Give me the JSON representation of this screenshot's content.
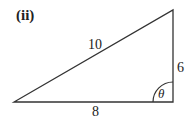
{
  "figure": {
    "part_label": "(ii)",
    "hypotenuse_label": "10",
    "vertical_side_label": "6",
    "base_label": "8",
    "angle_label": "θ",
    "stroke_color": "#333333"
  }
}
